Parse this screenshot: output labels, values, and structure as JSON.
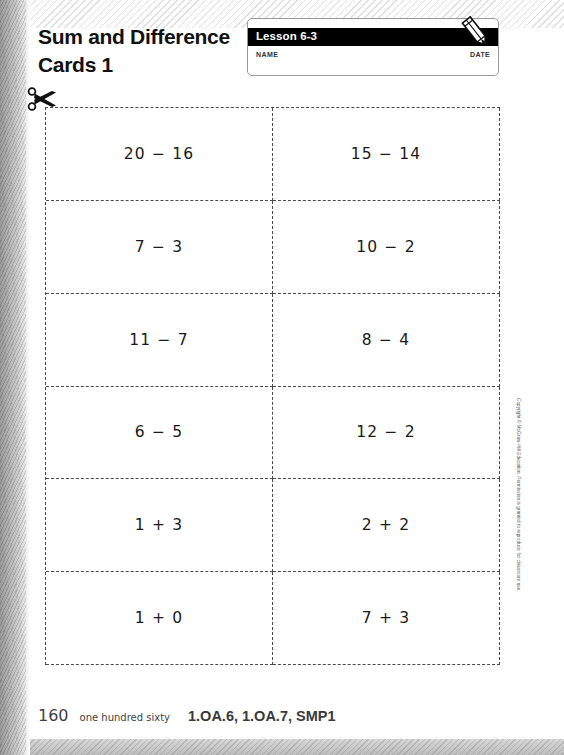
{
  "header": {
    "title": "Sum and Difference Cards 1",
    "lesson_label": "Lesson 6-3",
    "name_label": "NAME",
    "date_label": "DATE",
    "pencil_icon": "pencil-icon",
    "bar_color": "#000000"
  },
  "cut_line": {
    "scissors_icon": "scissors-icon"
  },
  "cards": [
    {
      "id": "card-1",
      "expression": "20 − 16"
    },
    {
      "id": "card-2",
      "expression": "15 − 14"
    },
    {
      "id": "card-3",
      "expression": "7 − 3"
    },
    {
      "id": "card-4",
      "expression": "10 − 2"
    },
    {
      "id": "card-5",
      "expression": "11 − 7"
    },
    {
      "id": "card-6",
      "expression": "8 − 4"
    },
    {
      "id": "card-7",
      "expression": "6 − 5"
    },
    {
      "id": "card-8",
      "expression": "12 − 2"
    },
    {
      "id": "card-9",
      "expression": "1 + 3"
    },
    {
      "id": "card-10",
      "expression": "2 + 2"
    },
    {
      "id": "card-11",
      "expression": "1 + 0"
    },
    {
      "id": "card-12",
      "expression": "7 + 3"
    }
  ],
  "copyright": "Copyright © McGraw-Hill Education. Permission is granted to reproduce for classroom use.",
  "footer": {
    "page_number": "160",
    "page_number_words": "one hundred sixty",
    "standards": "1.OA.6, 1.OA.7, SMP1"
  }
}
